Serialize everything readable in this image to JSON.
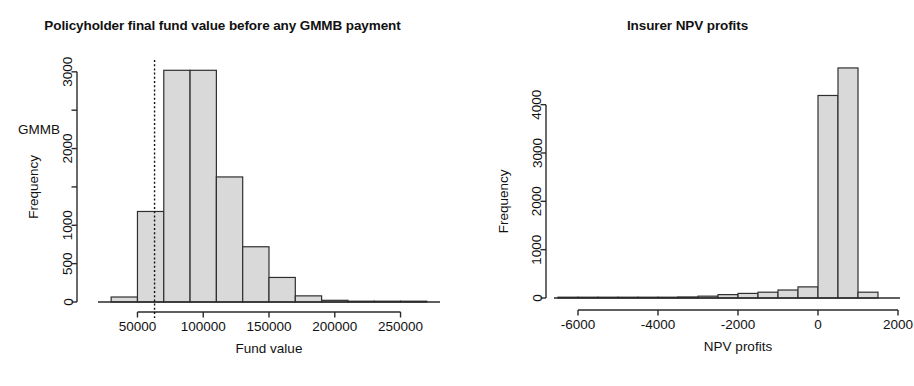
{
  "figure": {
    "background": "#ffffff",
    "bar_fill": "#d9d9d9",
    "bar_stroke": "#2f2f2f",
    "axis_color": "#2a2a2a"
  },
  "panels": [
    {
      "id": "left",
      "title": "Policyholder final fund value before any GMMB payment",
      "xlabel": "Fund value",
      "ylabel": "Frequency",
      "annotation": "GMMB"
    },
    {
      "id": "right",
      "title": "Insurer NPV profits",
      "xlabel": "NPV profits",
      "ylabel": "Frequency",
      "annotation": ""
    }
  ],
  "chart_data": [
    {
      "type": "bar",
      "id": "policyholder-fund-value-histogram",
      "title": "Policyholder final fund value before any GMMB payment",
      "xlabel": "Fund value",
      "ylabel": "Frequency",
      "xlim": [
        20000,
        280000
      ],
      "ylim": [
        0,
        3050
      ],
      "grid": false,
      "legend": null,
      "xticks": [
        50000,
        100000,
        150000,
        200000,
        250000
      ],
      "xticklabels": [
        "50000",
        "100000",
        "150000",
        "200000",
        "250000"
      ],
      "yticks": [
        0,
        500,
        1000,
        1500,
        2000,
        2500,
        3000
      ],
      "yticklabels": [
        "0",
        "500",
        "1000",
        "1500",
        "2000",
        "2500",
        "3000"
      ],
      "ylabelled_ticks": [
        "0",
        "500",
        "1000",
        "",
        "2000",
        "",
        "3000"
      ],
      "bin_width": 20000,
      "bin_edges": [
        30000,
        50000,
        70000,
        90000,
        110000,
        130000,
        150000,
        170000,
        190000,
        210000,
        230000,
        250000,
        270000
      ],
      "bin_centers": [
        40000,
        60000,
        80000,
        100000,
        120000,
        140000,
        160000,
        180000,
        200000,
        220000,
        240000,
        260000
      ],
      "values": [
        65,
        1180,
        3020,
        3020,
        1630,
        720,
        320,
        80,
        22,
        10,
        4,
        2
      ],
      "annotations": [
        {
          "text": "GMMB",
          "x": 46000,
          "y": 2250
        },
        {
          "type": "vline",
          "label": "GMMB guarantee level",
          "x": 63000,
          "style": "dashed"
        }
      ]
    },
    {
      "type": "bar",
      "id": "insurer-npv-profits-histogram",
      "title": "Insurer NPV profits",
      "xlabel": "NPV profits",
      "ylabel": "Frequency",
      "xlim": [
        -6600,
        2050
      ],
      "ylim": [
        0,
        4800
      ],
      "grid": false,
      "legend": null,
      "xticks": [
        -6000,
        -4000,
        -2000,
        0,
        2000
      ],
      "xticklabels": [
        "-6000",
        "-4000",
        "-2000",
        "0",
        "2000"
      ],
      "yticks": [
        0,
        1000,
        2000,
        3000,
        4000
      ],
      "yticklabels": [
        "0",
        "1000",
        "2000",
        "3000",
        "4000"
      ],
      "bin_width": 500,
      "bin_edges": [
        -6500,
        -6000,
        -5500,
        -5000,
        -4500,
        -4000,
        -3500,
        -3000,
        -2500,
        -2000,
        -1500,
        -1000,
        -500,
        0,
        500,
        1000,
        1500
      ],
      "bin_centers": [
        -6250,
        -5750,
        -5250,
        -4750,
        -4250,
        -3750,
        -3250,
        -2750,
        -2250,
        -1750,
        -1250,
        -750,
        -250,
        250,
        750,
        1250
      ],
      "values": [
        3,
        4,
        6,
        8,
        12,
        16,
        22,
        38,
        70,
        95,
        120,
        165,
        230,
        4190,
        4760,
        120
      ]
    }
  ]
}
